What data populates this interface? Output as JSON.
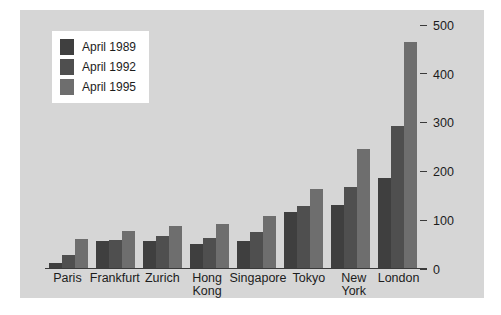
{
  "chart_data": {
    "type": "bar",
    "title": "",
    "subtitle": "",
    "xlabel": "",
    "ylabel": "",
    "ylim": [
      0,
      500
    ],
    "yticks": [
      0,
      100,
      200,
      300,
      400,
      500
    ],
    "ytick_labels": [
      "0",
      "100",
      "200",
      "300",
      "400",
      "500"
    ],
    "y_axis_position": "right",
    "grid": false,
    "legend_position": "top-left",
    "categories": [
      "Paris",
      "Frankfurt",
      "Zurich",
      "Hong Kong",
      "Singapore",
      "Tokyo",
      "New York",
      "London"
    ],
    "category_lines": [
      [
        "Paris"
      ],
      [
        "Frankfurt"
      ],
      [
        "Zurich"
      ],
      [
        "Hong",
        "Kong"
      ],
      [
        "Singapore"
      ],
      [
        "Tokyo"
      ],
      [
        "New",
        "York"
      ],
      [
        "London"
      ]
    ],
    "series": [
      {
        "name": "April 1989",
        "color": "#3f3f3f",
        "values": [
          10,
          55,
          56,
          49,
          55,
          115,
          129,
          184
        ]
      },
      {
        "name": "April 1992",
        "color": "#4f4f4f",
        "values": [
          26,
          57,
          66,
          61,
          74,
          128,
          167,
          291
        ]
      },
      {
        "name": "April 1995",
        "color": "#6e6e6e",
        "values": [
          59,
          76,
          87,
          91,
          106,
          161,
          244,
          464
        ]
      }
    ]
  },
  "legend": {
    "items": [
      {
        "label": "April 1989",
        "swatch": "series-0-swatch"
      },
      {
        "label": "April 1992",
        "swatch": "series-1-swatch"
      },
      {
        "label": "April 1995",
        "swatch": "series-2-swatch"
      }
    ]
  },
  "colors": {
    "page_background": "#ffffff",
    "panel_background": "#d6d6d6",
    "axis": "#3a3a3a",
    "text": "#1c1c1c",
    "legend_background": "#ffffff"
  }
}
